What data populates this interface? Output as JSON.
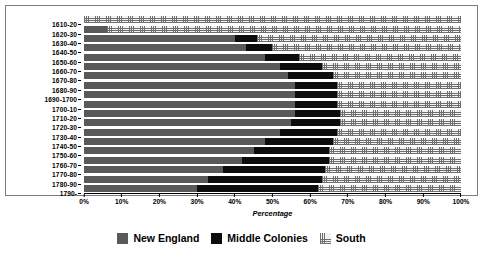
{
  "chart_data": {
    "type": "bar",
    "orientation": "horizontal",
    "stacked": true,
    "stack_mode": "percent",
    "title": "",
    "subtitle": "",
    "xlabel": "Percentage",
    "ylabel": "",
    "xlim": [
      0,
      100
    ],
    "xticks": [
      0,
      10,
      20,
      30,
      40,
      50,
      60,
      70,
      80,
      90,
      100
    ],
    "xticklabels": [
      "0%",
      "10%",
      "20%",
      "30%",
      "40%",
      "50%",
      "60%",
      "70%",
      "80%",
      "90%",
      "100%"
    ],
    "grid": false,
    "legend_position": "bottom",
    "categories": [
      "1610-20",
      "1620-30",
      "1630-40",
      "1640-50",
      "1650-60",
      "1660-70",
      "1670-80",
      "1680-90",
      "1690-1700",
      "1700-10",
      "1710-20",
      "1720-30",
      "1730-40",
      "1740-50",
      "1750-60",
      "1760-70",
      "1770-80",
      "1780-90",
      "1790-"
    ],
    "series": [
      {
        "name": "New England",
        "color": "#595959",
        "pattern": "solid-gray",
        "values": [
          0,
          6,
          40,
          43,
          48,
          52,
          54,
          56,
          56,
          56,
          56,
          55,
          52,
          48,
          45,
          42,
          37,
          33,
          30
        ]
      },
      {
        "name": "Middle Colonies",
        "color": "#0d0d0d",
        "pattern": "solid-black",
        "values": [
          0,
          0,
          6,
          7,
          9,
          11,
          12,
          11,
          11,
          11,
          12,
          13,
          15,
          18,
          20,
          23,
          27,
          30,
          32
        ]
      },
      {
        "name": "South",
        "color": "#f2f2f2",
        "pattern": "cross-hatch",
        "values": [
          100,
          94,
          54,
          50,
          43,
          37,
          34,
          33,
          33,
          33,
          32,
          32,
          33,
          34,
          35,
          35,
          36,
          37,
          38
        ]
      }
    ]
  },
  "legend": {
    "items": [
      {
        "label": "New England",
        "swatch": "solid-gray-swatch"
      },
      {
        "label": "Middle Colonies",
        "swatch": "solid-black-swatch"
      },
      {
        "label": "South",
        "swatch": "cross-hatch-swatch"
      }
    ]
  }
}
